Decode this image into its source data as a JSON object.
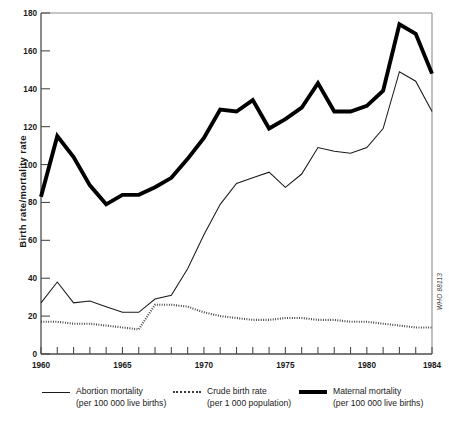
{
  "chart_data": {
    "type": "line",
    "title": "",
    "xlabel": "",
    "ylabel": "Birth rate/mortality rate",
    "xlim": [
      1960,
      1984
    ],
    "ylim": [
      0,
      180
    ],
    "grid": false,
    "legend_position": "bottom",
    "x": [
      1960,
      1961,
      1962,
      1963,
      1964,
      1965,
      1966,
      1967,
      1968,
      1969,
      1970,
      1971,
      1972,
      1973,
      1974,
      1975,
      1976,
      1977,
      1978,
      1979,
      1980,
      1981,
      1982,
      1983,
      1984
    ],
    "y_ticks": [
      0,
      20,
      40,
      60,
      80,
      100,
      120,
      140,
      160,
      180
    ],
    "x_ticks_labeled": [
      1960,
      1965,
      1970,
      1975,
      1980,
      1984
    ],
    "x_tick_step_minor": 1,
    "series": [
      {
        "name": "Abortion mortality",
        "units": "per 100 000 live births",
        "style": "solid-thin",
        "color": "#1a1a1a",
        "values": [
          27,
          38,
          27,
          28,
          25,
          22,
          22,
          29,
          31,
          45,
          63,
          79,
          90,
          93,
          96,
          88,
          95,
          109,
          107,
          106,
          109,
          119,
          149,
          144,
          128
        ]
      },
      {
        "name": "Crude birth rate",
        "units": "per 1 000 population",
        "style": "dotted",
        "color": "#3a3a3a",
        "values": [
          17,
          17,
          16,
          16,
          15,
          14,
          13,
          26,
          26,
          25,
          22,
          20,
          19,
          18,
          18,
          19,
          19,
          18,
          18,
          17,
          17,
          16,
          15,
          14,
          14
        ]
      },
      {
        "name": "Maternal mortality",
        "units": "per 100 000 live births",
        "style": "solid-thick",
        "color": "#000000",
        "values": [
          83,
          115,
          104,
          89,
          79,
          84,
          84,
          88,
          93,
          103,
          114,
          129,
          128,
          134,
          119,
          124,
          130,
          143,
          128,
          128,
          131,
          139,
          174,
          169,
          148
        ]
      }
    ]
  },
  "legend": {
    "items": [
      {
        "label": "Abortion mortality",
        "sub": "(per 100 000 live births)",
        "swatch": "solid-thin"
      },
      {
        "label": "Crude birth rate",
        "sub": "(per 1 000 population)",
        "swatch": "dotted"
      },
      {
        "label": "Maternal mortality",
        "sub": "(per 100 000 live births)",
        "swatch": "solid-thick"
      }
    ]
  },
  "annotations": {
    "who_stamp": "WHO 88113"
  }
}
